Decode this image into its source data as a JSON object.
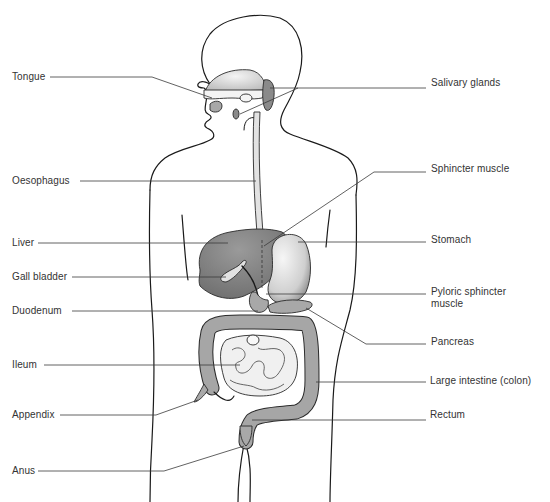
{
  "diagram": {
    "colors": {
      "background": "#ffffff",
      "outline": "#1a1a1a",
      "organ_dark": "#8a8a8a",
      "organ_light": "#e2e2e2",
      "label_text": "#333333"
    },
    "labels_left": [
      {
        "id": "tongue",
        "text": "Tongue"
      },
      {
        "id": "oesophagus",
        "text": "Oesophagus"
      },
      {
        "id": "liver",
        "text": "Liver"
      },
      {
        "id": "gall-bladder",
        "text": "Gall bladder"
      },
      {
        "id": "duodenum",
        "text": "Duodenum"
      },
      {
        "id": "ileum",
        "text": "Ileum"
      },
      {
        "id": "appendix",
        "text": "Appendix"
      },
      {
        "id": "anus",
        "text": "Anus"
      }
    ],
    "labels_right": [
      {
        "id": "salivary-glands",
        "text": "Salivary glands"
      },
      {
        "id": "sphincter-muscle",
        "text": "Sphincter muscle"
      },
      {
        "id": "stomach",
        "text": "Stomach"
      },
      {
        "id": "pyloric-sphincter",
        "text": "Pyloric sphincter",
        "text2": "muscle"
      },
      {
        "id": "pancreas",
        "text": "Pancreas"
      },
      {
        "id": "large-intestine",
        "text": "Large intestine (colon)"
      },
      {
        "id": "rectum",
        "text": "Rectum"
      }
    ]
  }
}
